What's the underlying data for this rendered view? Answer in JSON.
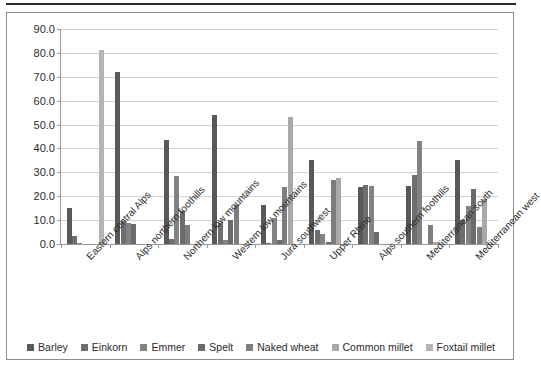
{
  "chart_data": {
    "type": "bar",
    "title": "",
    "subtitle": "",
    "xlabel": "",
    "ylabel": "",
    "ylim": [
      0,
      90
    ],
    "ytick_step": 10,
    "ytick_labels": [
      "0.0",
      "10.0",
      "20.0",
      "30.0",
      "40.0",
      "50.0",
      "60.0",
      "70.0",
      "80.0",
      "90.0"
    ],
    "grid": true,
    "legend_position": "bottom",
    "categories": [
      "Eastern central Alps",
      "Alps northern foothills",
      "Northern low mountains",
      "Western low mountains",
      "Jura southwest",
      "Upper Rhine",
      "Alps southern foothills",
      "Mediterranean south",
      "Mediterranean west"
    ],
    "series": [
      {
        "name": "Barley",
        "color": "#595959",
        "values": [
          15.0,
          71.8,
          43.6,
          54.2,
          16.2,
          35.0,
          24.0,
          24.2,
          35.0
        ]
      },
      {
        "name": "Einkorn",
        "color": "#6e6e6e",
        "values": [
          3.2,
          9.6,
          2.0,
          9.0,
          0.3,
          6.0,
          24.5,
          29.0,
          10.0
        ]
      },
      {
        "name": "Emmer",
        "color": "#828282",
        "values": [
          0.6,
          9.0,
          28.6,
          1.8,
          11.0,
          4.0,
          24.4,
          43.0,
          16.0
        ]
      },
      {
        "name": "Spelt",
        "color": "#6b6b6b",
        "values": [
          0.0,
          8.2,
          14.0,
          10.0,
          1.6,
          1.0,
          5.0,
          0.0,
          23.0
        ]
      },
      {
        "name": "Naked wheat",
        "color": "#7d7d7d",
        "values": [
          0.0,
          0.0,
          8.0,
          16.5,
          24.0,
          27.0,
          0.0,
          8.0,
          7.0
        ]
      },
      {
        "name": "Common millet",
        "color": "#a8a8a8",
        "values": [
          0.0,
          0.0,
          0.0,
          0.0,
          53.2,
          27.5,
          0.0,
          1.0,
          19.0
        ]
      },
      {
        "name": "Foxtail millet",
        "color": "#b5b5b5",
        "values": [
          81.2,
          0.0,
          0.0,
          0.0,
          0.0,
          0.0,
          0.0,
          0.0,
          0.0
        ]
      }
    ]
  }
}
